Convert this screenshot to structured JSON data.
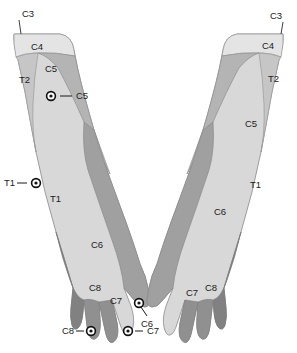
{
  "figure": {
    "background_color": "#ffffff",
    "outline_color": "#8a8a8a",
    "label_color": "#1b1b1b",
    "marker_color": "#111111",
    "bands": [
      {
        "code": "C3",
        "color": "#f2f2f2"
      },
      {
        "code": "C4",
        "color": "#e2e2e2"
      },
      {
        "code": "C5",
        "color": "#b6b6b6"
      },
      {
        "code": "C6",
        "color": "#9e9e9e"
      },
      {
        "code": "C7",
        "color": "#8f8f8f"
      },
      {
        "code": "C8",
        "color": "#808080"
      },
      {
        "code": "T1",
        "color": "#d8d8d8"
      },
      {
        "code": "T2",
        "color": "#c4c4c4"
      }
    ]
  },
  "left_limb": {
    "name": "left-upper-limb",
    "labels": [
      {
        "id": "l-c3",
        "text": "C3",
        "x": 22,
        "y": 14
      },
      {
        "id": "l-c4",
        "text": "C4",
        "x": 31,
        "y": 47
      },
      {
        "id": "l-c5",
        "text": "C5",
        "x": 45,
        "y": 69
      },
      {
        "id": "l-t2",
        "text": "T2",
        "x": 19,
        "y": 80
      },
      {
        "id": "l-t1",
        "text": "T1",
        "x": 50,
        "y": 199
      },
      {
        "id": "l-c6",
        "text": "C6",
        "x": 91,
        "y": 245
      },
      {
        "id": "l-c8",
        "text": "C8",
        "x": 89,
        "y": 288
      },
      {
        "id": "l-c7",
        "text": "C7",
        "x": 110,
        "y": 301
      }
    ],
    "markers": [
      {
        "id": "l-m-c5",
        "text": "C5",
        "cx": 51,
        "cy": 96,
        "lx": 70,
        "ly": 96,
        "label_x": 74,
        "label_y": 96
      },
      {
        "id": "l-m-t1",
        "text": "T1",
        "cx": 36,
        "cy": 183,
        "lx": 25,
        "ly": 183,
        "label_x": 13,
        "label_y": 183
      },
      {
        "id": "l-m-c6",
        "text": "C6",
        "cx": 139,
        "cy": 303,
        "lx": 146,
        "ly": 318,
        "label_x": 142,
        "label_y": 323
      },
      {
        "id": "l-m-c8",
        "text": "C8",
        "cx": 91,
        "cy": 331,
        "lx": 82,
        "ly": 331,
        "label_x": 70,
        "label_y": 331
      },
      {
        "id": "l-m-c7",
        "text": "C7",
        "cx": 128,
        "cy": 331,
        "lx": 137,
        "ly": 331,
        "label_x": 141,
        "label_y": 331
      }
    ],
    "leader_c3": {
      "x1": 19,
      "y1": 20,
      "x2": 21,
      "y2": 34
    }
  },
  "right_limb": {
    "name": "right-upper-limb",
    "labels": [
      {
        "id": "r-c3",
        "text": "C3",
        "x": 277,
        "y": 16
      },
      {
        "id": "r-c4",
        "text": "C4",
        "x": 268,
        "y": 46
      },
      {
        "id": "r-t2",
        "text": "T2",
        "x": 274,
        "y": 79
      },
      {
        "id": "r-c5",
        "text": "C5",
        "x": 251,
        "y": 124
      },
      {
        "id": "r-t1",
        "text": "T1",
        "x": 256,
        "y": 185
      },
      {
        "id": "r-c6",
        "text": "C6",
        "x": 220,
        "y": 212
      },
      {
        "id": "r-c7",
        "text": "C7",
        "x": 192,
        "y": 293
      },
      {
        "id": "r-c8",
        "text": "C8",
        "x": 211,
        "y": 288
      }
    ],
    "markers": [],
    "leader_c3": {
      "x1": 283,
      "y1": 22,
      "x2": 281,
      "y2": 34
    }
  },
  "caption": {
    "text": "",
    "visible": false
  }
}
